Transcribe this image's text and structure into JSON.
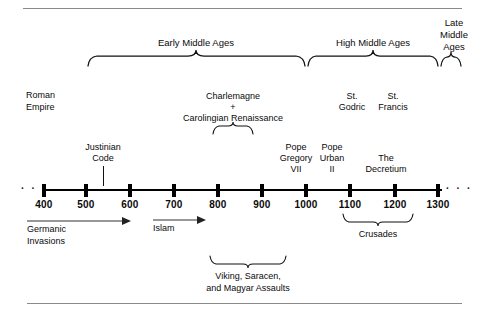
{
  "figure": {
    "title_region": "medieval-history-timeline",
    "axis": {
      "ticks": [
        {
          "label": "400",
          "x": 44
        },
        {
          "label": "500",
          "x": 86
        },
        {
          "label": "600",
          "x": 130
        },
        {
          "label": "700",
          "x": 174
        },
        {
          "label": "800",
          "x": 218
        },
        {
          "label": "900",
          "x": 262
        },
        {
          "label": "1000",
          "x": 306
        },
        {
          "label": "1100",
          "x": 350
        },
        {
          "label": "1200",
          "x": 395
        },
        {
          "label": "1300",
          "x": 438
        }
      ],
      "left_ellipsis": "· · ·",
      "right_ellipsis": "· · ·"
    },
    "eras": [
      {
        "name": "early-middle-ages",
        "label": "Early Middle Ages",
        "label_lines": [
          "Early Middle Ages"
        ],
        "from": 88,
        "to": 305
      },
      {
        "name": "high-middle-ages",
        "label": "High Middle Ages",
        "label_lines": [
          "High Middle Ages"
        ],
        "from": 308,
        "to": 438
      },
      {
        "name": "late-middle-ages",
        "label": "Late Middle Ages",
        "label_lines": [
          "Late",
          "Middle",
          "Ages"
        ],
        "from": 440,
        "to": 462
      }
    ],
    "above_labels": [
      {
        "name": "roman-empire",
        "lines": [
          "Roman",
          "Empire"
        ]
      },
      {
        "name": "charlemagne-carolingian",
        "lines": [
          "Charlemagne",
          "+",
          "Carolingian Renaissance"
        ]
      },
      {
        "name": "st-godric",
        "lines": [
          "St.",
          "Godric"
        ]
      },
      {
        "name": "st-francis",
        "lines": [
          "St.",
          "Francis"
        ]
      },
      {
        "name": "pope-gregory-vii",
        "lines": [
          "Pope",
          "Gregory",
          "VII"
        ]
      },
      {
        "name": "pope-urban-ii",
        "lines": [
          "Pope",
          "Urban",
          "II"
        ]
      },
      {
        "name": "the-decretium",
        "lines": [
          "The",
          "Decretium"
        ]
      },
      {
        "name": "justinian-code",
        "lines": [
          "Justinian",
          "Code"
        ]
      }
    ],
    "below_labels": [
      {
        "name": "germanic-invasions",
        "lines": [
          "Germanic",
          "Invasions"
        ]
      },
      {
        "name": "islam",
        "lines": [
          "Islam"
        ]
      },
      {
        "name": "crusades",
        "lines": [
          "Crusades"
        ]
      },
      {
        "name": "viking-saracen-magyar",
        "lines": [
          "Viking, Saracen,",
          "and Magyar Assaults"
        ]
      }
    ],
    "text": {
      "early_middle_ages": "Early Middle Ages",
      "high_middle_ages": "High Middle Ages",
      "late_1": "Late",
      "late_2": "Middle",
      "late_3": "Ages",
      "roman_1": "Roman",
      "roman_2": "Empire",
      "charlemagne": "Charlemagne",
      "plus": "+",
      "carolingian": "Carolingian Renaissance",
      "st_1": "St.",
      "godric": "Godric",
      "st_2": "St.",
      "francis": "Francis",
      "pope_1": "Pope",
      "gregory": "Gregory",
      "vii": "VII",
      "pope_2": "Pope",
      "urban": "Urban",
      "ii": "II",
      "the": "The",
      "decretium": "Decretium",
      "justinian": "Justinian",
      "code": "Code",
      "germanic": "Germanic",
      "invasions": "Invasions",
      "islam": "Islam",
      "crusades": "Crusades",
      "viking_line1": "Viking, Saracen,",
      "viking_line2": "and Magyar Assaults",
      "y400": "400",
      "y500": "500",
      "y600": "600",
      "y700": "700",
      "y800": "800",
      "y900": "900",
      "y1000": "1000",
      "y1100": "1100",
      "y1200": "1200",
      "y1300": "1300",
      "dots_left": "· · ·",
      "dots_right": "· · ·"
    },
    "colors": {
      "ink": "#0a0a0a",
      "rule": "#8a8a8a",
      "background": "#ffffff",
      "arrow": "#333333"
    }
  }
}
